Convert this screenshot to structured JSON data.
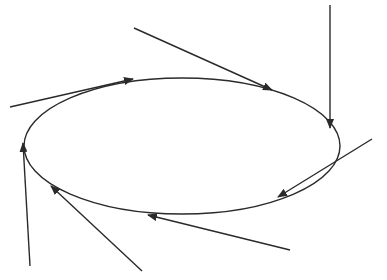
{
  "diagram": {
    "type": "orbit-with-tangent-arrows",
    "stroke_color": "#2a2a2a",
    "background": "#ffffff",
    "ellipse": {
      "cx": 182,
      "cy": 146,
      "rx": 158,
      "ry": 68
    },
    "arrows": [
      {
        "id": "arrow-1",
        "x1": 10,
        "y1": 107,
        "x2": 133,
        "y2": 79
      },
      {
        "id": "arrow-2",
        "x1": 134,
        "y1": 28,
        "x2": 272,
        "y2": 90
      },
      {
        "id": "arrow-3",
        "x1": 330,
        "y1": 5,
        "x2": 330,
        "y2": 128
      },
      {
        "id": "arrow-4",
        "x1": 372,
        "y1": 139,
        "x2": 278,
        "y2": 197
      },
      {
        "id": "arrow-5",
        "x1": 290,
        "y1": 250,
        "x2": 148,
        "y2": 215
      },
      {
        "id": "arrow-6",
        "x1": 142,
        "y1": 271,
        "x2": 51,
        "y2": 186
      },
      {
        "id": "arrow-7",
        "x1": 30,
        "y1": 266,
        "x2": 23,
        "y2": 143
      }
    ]
  }
}
